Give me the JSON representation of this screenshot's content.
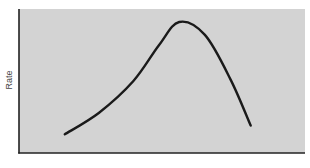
{
  "chart_data": {
    "type": "line",
    "title": "",
    "xlabel": "",
    "ylabel": "Rate",
    "x_ticks": [],
    "y_ticks": [],
    "grid": false,
    "legend": null,
    "xlim": [
      0,
      100
    ],
    "ylim": [
      0,
      100
    ],
    "series": [
      {
        "name": "Rate",
        "color": "#1a1a1a",
        "x": [
          16,
          28,
          40,
          49,
          56,
          65,
          74,
          81
        ],
        "y": [
          13,
          28,
          50,
          75,
          91,
          82,
          51,
          19
        ]
      }
    ],
    "annotations": []
  },
  "style": {
    "plot_bg": "#d3d3d3",
    "axis_color": "#222222",
    "line_color": "#1a1a1a"
  }
}
